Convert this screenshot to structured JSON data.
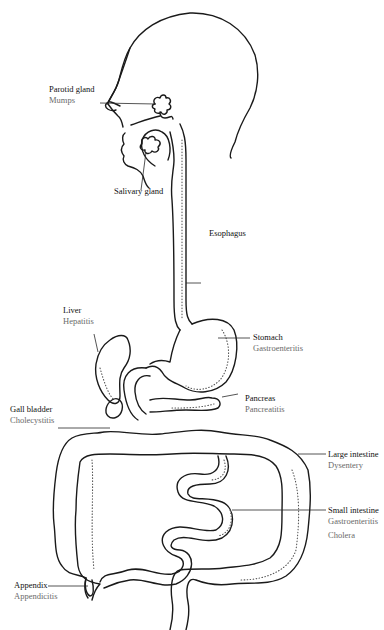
{
  "diagram": {
    "type": "anatomical illustration",
    "colors": {
      "line": "#1a1a1a",
      "organ_label": "#111111",
      "disease_label": "#6a6a6a",
      "background": "#ffffff"
    }
  },
  "labels": {
    "parotid": {
      "organ": "Parotid gland",
      "disease": "Mumps"
    },
    "salivary": {
      "organ": "Salivary gland"
    },
    "esophagus": {
      "organ": "Esophagus"
    },
    "liver": {
      "organ": "Liver",
      "disease": "Hepatitis"
    },
    "stomach": {
      "organ": "Stomach",
      "disease": "Gastroenteritis"
    },
    "gallbladder": {
      "organ": "Gall bladder",
      "disease": "Cholecystitis"
    },
    "pancreas": {
      "organ": "Pancreas",
      "disease": "Pancreatitis"
    },
    "large_intestine": {
      "organ": "Large intestine",
      "disease": "Dysentery"
    },
    "small_intestine": {
      "organ": "Small intestine",
      "disease": "Gastroenteritis",
      "disease2": "Cholera"
    },
    "appendix": {
      "organ": "Appendix",
      "disease": "Appendicitis"
    }
  }
}
